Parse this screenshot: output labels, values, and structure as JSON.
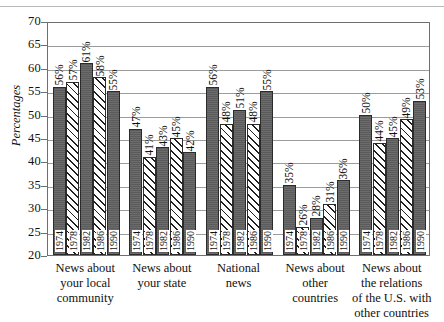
{
  "chart_data": {
    "type": "bar",
    "title": "",
    "xlabel": "",
    "ylabel": "Percentages",
    "ylim": [
      20,
      70
    ],
    "ytick_step": 5,
    "yticks": [
      70,
      65,
      60,
      55,
      50,
      45,
      40,
      35,
      30,
      25,
      20
    ],
    "grid": true,
    "legend": "none",
    "value_suffix": "%",
    "series_names": [
      "1974",
      "1978",
      "1982",
      "1986",
      "1990"
    ],
    "categories": [
      "News about your local community",
      "News about your state",
      "National news",
      "News about other countries",
      "News about the relations of the U.S. with other countries"
    ],
    "series": [
      {
        "name": "1974",
        "values": [
          56,
          47,
          56,
          35,
          50
        ]
      },
      {
        "name": "1978",
        "values": [
          57,
          41,
          48,
          26,
          44
        ]
      },
      {
        "name": "1982",
        "values": [
          61,
          43,
          51,
          28,
          45
        ]
      },
      {
        "name": "1986",
        "values": [
          58,
          45,
          48,
          31,
          49
        ]
      },
      {
        "name": "1990",
        "values": [
          55,
          42,
          55,
          36,
          53
        ]
      }
    ],
    "groups": [
      {
        "label_lines": [
          "News about",
          "your local",
          "community"
        ],
        "bars": [
          {
            "year": "1974",
            "value": 56,
            "label": "56%",
            "fill": "solid"
          },
          {
            "year": "1978",
            "value": 57,
            "label": "57%",
            "fill": "hatch"
          },
          {
            "year": "1982",
            "value": 61,
            "label": "61%",
            "fill": "solid"
          },
          {
            "year": "1986",
            "value": 58,
            "label": "58%",
            "fill": "hatch"
          },
          {
            "year": "1990",
            "value": 55,
            "label": "55%",
            "fill": "solid"
          }
        ]
      },
      {
        "label_lines": [
          "News about",
          "your state"
        ],
        "bars": [
          {
            "year": "1974",
            "value": 47,
            "label": "47%",
            "fill": "solid"
          },
          {
            "year": "1978",
            "value": 41,
            "label": "41%",
            "fill": "hatch"
          },
          {
            "year": "1982",
            "value": 43,
            "label": "43%",
            "fill": "solid"
          },
          {
            "year": "1986",
            "value": 45,
            "label": "45%",
            "fill": "hatch"
          },
          {
            "year": "1990",
            "value": 42,
            "label": "42%",
            "fill": "solid"
          }
        ]
      },
      {
        "label_lines": [
          "National",
          "news"
        ],
        "bars": [
          {
            "year": "1974",
            "value": 56,
            "label": "56%",
            "fill": "solid"
          },
          {
            "year": "1978",
            "value": 48,
            "label": "48%",
            "fill": "hatch"
          },
          {
            "year": "1982",
            "value": 51,
            "label": "51%",
            "fill": "solid"
          },
          {
            "year": "1986",
            "value": 48,
            "label": "48%",
            "fill": "hatch"
          },
          {
            "year": "1990",
            "value": 55,
            "label": "55%",
            "fill": "solid"
          }
        ]
      },
      {
        "label_lines": [
          "News about",
          "other",
          "countries"
        ],
        "bars": [
          {
            "year": "1974",
            "value": 35,
            "label": "35%",
            "fill": "solid"
          },
          {
            "year": "1978",
            "value": 26,
            "label": "26%",
            "fill": "hatch"
          },
          {
            "year": "1982",
            "value": 28,
            "label": "28%",
            "fill": "solid"
          },
          {
            "year": "1986",
            "value": 31,
            "label": "31%",
            "fill": "hatch"
          },
          {
            "year": "1990",
            "value": 36,
            "label": "36%",
            "fill": "solid"
          }
        ]
      },
      {
        "label_lines": [
          "News about",
          "the relations",
          "of the U.S. with",
          "other countries"
        ],
        "bars": [
          {
            "year": "1974",
            "value": 50,
            "label": "50%",
            "fill": "solid"
          },
          {
            "year": "1978",
            "value": 44,
            "label": "44%",
            "fill": "hatch"
          },
          {
            "year": "1982",
            "value": 45,
            "label": "45%",
            "fill": "solid"
          },
          {
            "year": "1986",
            "value": 49,
            "label": "49%",
            "fill": "hatch"
          },
          {
            "year": "1990",
            "value": 53,
            "label": "53%",
            "fill": "solid"
          }
        ]
      }
    ]
  },
  "colors": {
    "bar_solid": "#5b5b5b",
    "bar_hatch_line": "#1f1f1f",
    "bar_outline": "#2b2b2b",
    "grid": "#9c9c9c",
    "axis": "#6f6f6f",
    "background": "#ffffff",
    "text": "#111111"
  }
}
